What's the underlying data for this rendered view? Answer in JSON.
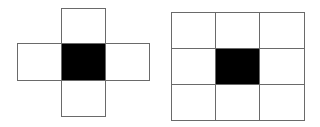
{
  "diagrams": [
    {
      "name": "cross-neighborhood",
      "description": "4-neighborhood (von Neumann) around a center pixel",
      "cells": [
        {
          "id": "top",
          "x": 61,
          "y": 8,
          "w": 45,
          "h": 36,
          "filled": false
        },
        {
          "id": "left",
          "x": 17,
          "y": 43,
          "w": 45,
          "h": 38,
          "filled": false
        },
        {
          "id": "center",
          "x": 61,
          "y": 43,
          "w": 45,
          "h": 38,
          "filled": true
        },
        {
          "id": "right",
          "x": 105,
          "y": 43,
          "w": 45,
          "h": 38,
          "filled": false
        },
        {
          "id": "bottom",
          "x": 61,
          "y": 80,
          "w": 45,
          "h": 37,
          "filled": false
        }
      ]
    },
    {
      "name": "square-neighborhood",
      "description": "8-neighborhood (Moore) 3x3 grid around a center pixel",
      "cells": [
        {
          "id": "r0c0",
          "x": 171,
          "y": 12,
          "w": 45,
          "h": 37,
          "filled": false
        },
        {
          "id": "r0c1",
          "x": 215,
          "y": 12,
          "w": 45,
          "h": 37,
          "filled": false
        },
        {
          "id": "r0c2",
          "x": 259,
          "y": 12,
          "w": 46,
          "h": 37,
          "filled": false
        },
        {
          "id": "r1c0",
          "x": 171,
          "y": 48,
          "w": 45,
          "h": 37,
          "filled": false
        },
        {
          "id": "r1c1",
          "x": 215,
          "y": 48,
          "w": 45,
          "h": 37,
          "filled": true
        },
        {
          "id": "r1c2",
          "x": 259,
          "y": 48,
          "w": 46,
          "h": 37,
          "filled": false
        },
        {
          "id": "r2c0",
          "x": 171,
          "y": 84,
          "w": 45,
          "h": 37,
          "filled": false
        },
        {
          "id": "r2c1",
          "x": 215,
          "y": 84,
          "w": 45,
          "h": 37,
          "filled": false
        },
        {
          "id": "r2c2",
          "x": 259,
          "y": 84,
          "w": 46,
          "h": 37,
          "filled": false
        }
      ]
    }
  ],
  "colors": {
    "line": "#6a6a6a",
    "fill": "#000000",
    "background": "#ffffff"
  }
}
